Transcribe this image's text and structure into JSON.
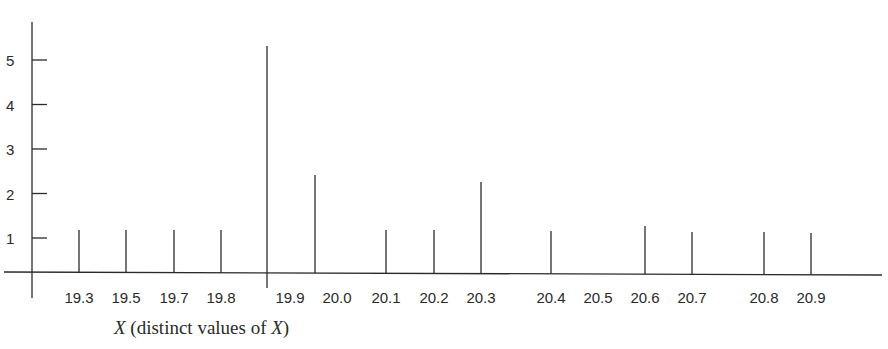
{
  "chart_data": {
    "type": "bar",
    "style": "spike/line plot (frequency of distinct values)",
    "title": "",
    "xlabel": "X (distinct values of X)",
    "xlabel_parts": [
      {
        "text": "X",
        "italic": true
      },
      {
        "text": " (distinct values of ",
        "italic": false
      },
      {
        "text": "X",
        "italic": true
      },
      {
        "text": ")",
        "italic": false
      }
    ],
    "ylabel": "",
    "ylim": [
      0,
      5.5
    ],
    "y_ticks": [
      1,
      2,
      3,
      4,
      5
    ],
    "grid": false,
    "legend": null,
    "categories": [
      "19.3",
      "19.5",
      "19.7",
      "19.8",
      "19.9",
      "20.0",
      "20.1",
      "20.2",
      "20.3",
      "20.4",
      "20.5",
      "20.6",
      "20.7",
      "20.8",
      "20.9"
    ],
    "values": [
      1,
      1,
      1,
      1,
      5,
      2,
      1,
      1,
      2,
      1,
      0,
      1,
      1,
      1,
      1
    ]
  }
}
